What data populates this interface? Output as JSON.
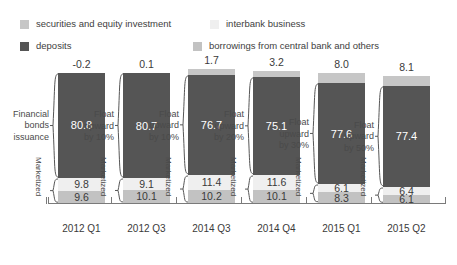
{
  "legend": {
    "items": [
      {
        "label": "securities and equity investment",
        "color": "#c6c6c6",
        "key": "securities"
      },
      {
        "label": "interbank business",
        "color": "#efefef",
        "key": "interbank"
      },
      {
        "label": "deposits",
        "color": "#555555",
        "key": "deposits"
      },
      {
        "label": "borrowings from central bank and others",
        "color": "#c2c2c2",
        "key": "borrowings"
      }
    ]
  },
  "annotations": {
    "marketized_label": "Marketized",
    "left_labels": [
      "Financial bonds issuance",
      "Float upward by 10%",
      "Float upward by 10%",
      "Float upward by 20%",
      "Float upward by 30%",
      "Float upward by 50%"
    ],
    "left_labels_lines": [
      [
        "Financial",
        "bonds",
        "issuance"
      ],
      [
        "Float",
        "upward",
        "by 10%"
      ],
      [
        "Float",
        "upward",
        "by 10%"
      ],
      [
        "Float",
        "upward",
        "by 20%"
      ],
      [
        "Float",
        "upward",
        "by 30%"
      ],
      [
        "Float",
        "upward",
        "by 50%"
      ]
    ]
  },
  "chart_data": {
    "type": "bar",
    "title": "",
    "subtitle": "",
    "xlabel": "",
    "ylabel": "",
    "stacked": true,
    "grid": false,
    "legend_position": "top",
    "categories": [
      "2012 Q1",
      "2012 Q3",
      "2014 Q3",
      "2014 Q4",
      "2015 Q1",
      "2015 Q2"
    ],
    "series": [
      {
        "name": "securities and equity investment",
        "color": "#c6c6c6",
        "values": [
          -0.2,
          0.1,
          1.7,
          3.2,
          8.0,
          8.1
        ]
      },
      {
        "name": "deposits",
        "color": "#555555",
        "values": [
          80.8,
          80.7,
          76.7,
          75.1,
          77.6,
          77.4
        ]
      },
      {
        "name": "interbank business",
        "color": "#efefef",
        "values": [
          9.8,
          9.1,
          11.4,
          11.6,
          6.1,
          6.4
        ]
      },
      {
        "name": "borrowings from central bank and others",
        "color": "#c2c2c2",
        "values": [
          9.6,
          10.1,
          10.2,
          10.1,
          8.3,
          6.1
        ]
      }
    ],
    "value_labels": {
      "securities": [
        "-0.2",
        "0.1",
        "1.7",
        "3.2",
        "8.0",
        "8.1"
      ],
      "deposits": [
        "80.8",
        "80.7",
        "76.7",
        "75.1",
        "77.6",
        "77.4"
      ],
      "interbank": [
        "9.8",
        "9.1",
        "11.4",
        "11.6",
        "6.1",
        "6.4"
      ],
      "borrowings": [
        "9.6",
        "10.1",
        "10.2",
        "10.1",
        "8.3",
        "6.1"
      ]
    },
    "ylim": [
      0,
      100
    ],
    "unit": "%"
  }
}
